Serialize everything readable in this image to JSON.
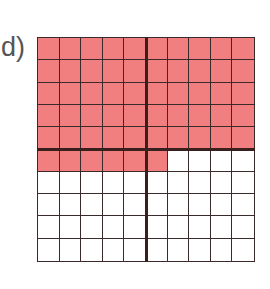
{
  "label": "d)",
  "grid": {
    "rows": 10,
    "cols": 10,
    "shaded_count": 56,
    "shaded_description": "Top 5 rows fully shaded plus first 6 cells of row 6",
    "shade_color": "#f27f7f",
    "line_color": "#3a2a2a",
    "thick_divider_after_col": 5,
    "thick_divider_after_row": 5
  }
}
